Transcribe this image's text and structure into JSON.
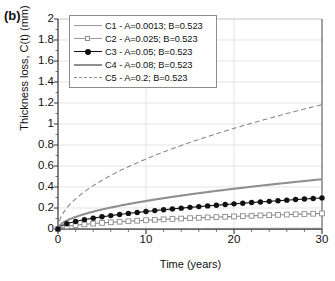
{
  "figure": {
    "panel_label": "(b)"
  },
  "chart_data": {
    "type": "line",
    "title": "",
    "xlabel": "Time (years)",
    "ylabel": "Thickness loss, C(t) (mm)",
    "xlim": [
      0,
      30
    ],
    "ylim": [
      0,
      2
    ],
    "xticks": [
      0,
      10,
      20,
      30
    ],
    "xtick_labels": [
      "0",
      "10",
      "20",
      "30"
    ],
    "x_minor_tick_step": 2,
    "yticks": [
      0,
      0.2,
      0.4,
      0.6,
      0.8,
      1,
      1.2,
      1.4,
      1.6,
      1.8,
      2
    ],
    "ytick_labels": [
      "0",
      "0.2",
      "0.4",
      "0.6",
      "0.8",
      "1",
      "1.2",
      "1.4",
      "1.6",
      "1.8",
      "2"
    ],
    "grid": true,
    "grid_color": "#d8d8d8",
    "legend_position": "top-left",
    "model": "C(t) = A * t^B",
    "x": [
      0,
      1,
      2,
      3,
      4,
      5,
      6,
      7,
      8,
      9,
      10,
      11,
      12,
      13,
      14,
      15,
      16,
      17,
      18,
      19,
      20,
      21,
      22,
      23,
      24,
      25,
      26,
      27,
      28,
      29,
      30
    ],
    "series": [
      {
        "name": "C1 - A=0.0013; B=0.523",
        "label": "C1 - A=0.0013; B=0.523",
        "A": 0.0013,
        "B": 0.523,
        "color": "#9a9a9a",
        "style": "solid-thin",
        "marker": "none",
        "values": [
          0,
          0.0013,
          0.0019,
          0.0023,
          0.0027,
          0.003,
          0.0033,
          0.0036,
          0.0038,
          0.0041,
          0.0043,
          0.0045,
          0.0047,
          0.0049,
          0.0051,
          0.0053,
          0.0055,
          0.0057,
          0.0059,
          0.006,
          0.0062,
          0.0064,
          0.0065,
          0.0067,
          0.0068,
          0.007,
          0.0071,
          0.0073,
          0.0074,
          0.0075,
          0.0077
        ],
        "value_at_30": 0.0077
      },
      {
        "name": "C2 - A=0.025; B=0.523",
        "label": "C2 - A=0.025; B=0.523",
        "A": 0.025,
        "B": 0.523,
        "color": "#8a8a8a",
        "style": "solid-thin",
        "marker": "open-square",
        "values": [
          0,
          0.025,
          0.0359,
          0.0445,
          0.0516,
          0.058,
          0.0638,
          0.0691,
          0.0741,
          0.0787,
          0.0832,
          0.0874,
          0.0915,
          0.0954,
          0.0991,
          0.1028,
          0.1063,
          0.1097,
          0.113,
          0.1162,
          0.1194,
          0.1225,
          0.1255,
          0.1284,
          0.1313,
          0.1341,
          0.1369,
          0.1396,
          0.1423,
          0.1449,
          0.1475
        ],
        "value_at_30": 0.1475
      },
      {
        "name": "C3 - A=0.05; B=0.523",
        "label": "C3 - A=0.05; B=0.523",
        "A": 0.05,
        "B": 0.523,
        "color": "#111111",
        "style": "solid-thin",
        "marker": "filled-circle",
        "values": [
          0,
          0.05,
          0.0718,
          0.089,
          0.1031,
          0.1159,
          0.1277,
          0.1383,
          0.1482,
          0.1575,
          0.1663,
          0.1748,
          0.1829,
          0.1907,
          0.1983,
          0.2056,
          0.2127,
          0.2195,
          0.2261,
          0.2325,
          0.2388,
          0.245,
          0.251,
          0.2569,
          0.2626,
          0.2682,
          0.2738,
          0.2792,
          0.2845,
          0.2898,
          0.2949
        ],
        "value_at_30": 0.2949
      },
      {
        "name": "C4 - A=0.08; B=0.523",
        "label": "C4 - A=0.08; B=0.523",
        "A": 0.08,
        "B": 0.523,
        "color": "#8f8f8f",
        "style": "solid-thick",
        "marker": "none",
        "values": [
          0,
          0.08,
          0.1149,
          0.1424,
          0.165,
          0.1855,
          0.2043,
          0.2213,
          0.2372,
          0.252,
          0.2661,
          0.2797,
          0.2926,
          0.3052,
          0.3172,
          0.329,
          0.3403,
          0.3512,
          0.3618,
          0.3721,
          0.3821,
          0.3919,
          0.4016,
          0.411,
          0.4202,
          0.4292,
          0.438,
          0.4467,
          0.4553,
          0.4637,
          0.4719
        ],
        "value_at_30": 0.4719
      },
      {
        "name": "C5 - A=0.2; B=0.523",
        "label": "C5 - A=0.2; B=0.523",
        "A": 0.2,
        "B": 0.523,
        "color": "#8a8a8a",
        "style": "dashed",
        "marker": "none",
        "values": [
          0,
          0.2,
          0.2872,
          0.356,
          0.4126,
          0.4637,
          0.5108,
          0.5532,
          0.593,
          0.63,
          0.6653,
          0.6991,
          0.7316,
          0.7629,
          0.7931,
          0.8225,
          0.8507,
          0.8781,
          0.9046,
          0.9303,
          0.9554,
          0.9798,
          1.004,
          1.0275,
          1.0505,
          1.073,
          1.0951,
          1.1168,
          1.1382,
          1.1593,
          1.1798
        ],
        "value_at_30": 1.1798
      }
    ]
  }
}
